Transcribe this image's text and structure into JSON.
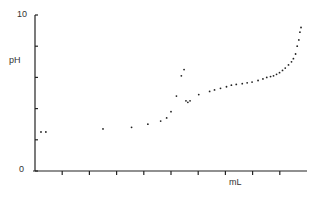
{
  "chart_data": {
    "type": "scatter",
    "title": "",
    "xlabel": "mL",
    "ylabel": "pH",
    "ylim": [
      0,
      10
    ],
    "xlim": [
      0,
      10
    ],
    "y_tick_labels": [
      "0",
      "10"
    ],
    "y_ticks": [
      0,
      2,
      4,
      6,
      8,
      10
    ],
    "x_ticks": [
      1,
      2,
      3,
      4,
      5,
      6,
      7,
      8,
      9
    ],
    "grid": false,
    "legend": null,
    "series": [
      {
        "name": "titration",
        "x": [
          0.22,
          0.4,
          2.5,
          3.55,
          4.15,
          4.62,
          4.84,
          5.0,
          5.2,
          5.38,
          5.48,
          5.55,
          5.62,
          5.7,
          6.02,
          6.42,
          6.6,
          6.82,
          7.04,
          7.22,
          7.4,
          7.62,
          7.8,
          7.98,
          8.2,
          8.38,
          8.52,
          8.66,
          8.77,
          8.88,
          8.99,
          9.1,
          9.2,
          9.32,
          9.43,
          9.5,
          9.58,
          9.64,
          9.7,
          9.74,
          9.78
        ],
        "y": [
          2.5,
          2.5,
          2.7,
          2.8,
          3.0,
          3.2,
          3.4,
          3.8,
          4.8,
          6.1,
          6.5,
          4.5,
          4.4,
          4.5,
          4.9,
          5.1,
          5.2,
          5.3,
          5.4,
          5.5,
          5.55,
          5.6,
          5.65,
          5.7,
          5.8,
          5.9,
          6.0,
          6.05,
          6.1,
          6.2,
          6.3,
          6.45,
          6.6,
          6.8,
          7.0,
          7.2,
          7.5,
          8.0,
          8.4,
          8.9,
          9.2
        ]
      }
    ]
  }
}
